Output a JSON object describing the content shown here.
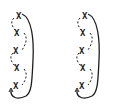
{
  "figures": [
    {
      "id": "left",
      "offset_x": 4,
      "nodes": [
        {
          "label": "X",
          "x": 12,
          "y": 12
        },
        {
          "label": "X",
          "x": 10,
          "y": 29
        },
        {
          "label": "X",
          "x": 9,
          "y": 47
        },
        {
          "label": "X",
          "x": 10,
          "y": 64
        },
        {
          "label": "X",
          "x": 9,
          "y": 82
        }
      ]
    },
    {
      "id": "right",
      "offset_x": 70,
      "nodes": [
        {
          "label": "X",
          "x": 12,
          "y": 12
        },
        {
          "label": "X",
          "x": 10,
          "y": 29
        },
        {
          "label": "X",
          "x": 9,
          "y": 47
        },
        {
          "label": "X",
          "x": 10,
          "y": 64
        },
        {
          "label": "X",
          "x": 9,
          "y": 82
        }
      ]
    }
  ],
  "colors": {
    "ink": "#1e1e1e",
    "background": "#ffffff"
  }
}
